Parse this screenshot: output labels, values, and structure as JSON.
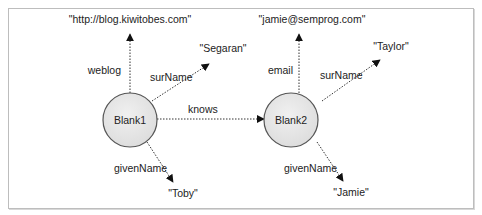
{
  "diagram": {
    "type": "rdf-graph",
    "colors": {
      "node_fill": "#e6e6e6",
      "node_stroke": "#555555",
      "edge": "#333333",
      "frame": "#bdbdbd"
    },
    "nodes": [
      {
        "id": "blank1",
        "label": "Blank1",
        "kind": "blank-node"
      },
      {
        "id": "blank2",
        "label": "Blank2",
        "kind": "blank-node"
      },
      {
        "id": "lit_weblog",
        "label": "\"http://blog.kiwitobes.com\"",
        "kind": "literal"
      },
      {
        "id": "lit_segaran",
        "label": "\"Segaran\"",
        "kind": "literal"
      },
      {
        "id": "lit_toby",
        "label": "\"Toby\"",
        "kind": "literal"
      },
      {
        "id": "lit_email",
        "label": "\"jamie@semprog.com\"",
        "kind": "literal"
      },
      {
        "id": "lit_taylor",
        "label": "\"Taylor\"",
        "kind": "literal"
      },
      {
        "id": "lit_jamie",
        "label": "\"Jamie\"",
        "kind": "literal"
      }
    ],
    "edges": [
      {
        "from": "blank1",
        "to": "lit_weblog",
        "label": "weblog"
      },
      {
        "from": "blank1",
        "to": "lit_segaran",
        "label": "surName"
      },
      {
        "from": "blank1",
        "to": "lit_toby",
        "label": "givenName"
      },
      {
        "from": "blank1",
        "to": "blank2",
        "label": "knows"
      },
      {
        "from": "blank2",
        "to": "lit_email",
        "label": "email"
      },
      {
        "from": "blank2",
        "to": "lit_taylor",
        "label": "surName"
      },
      {
        "from": "blank2",
        "to": "lit_jamie",
        "label": "givenName"
      }
    ]
  }
}
